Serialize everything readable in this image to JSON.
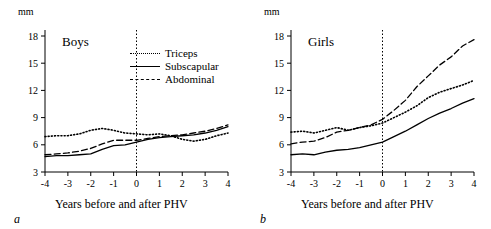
{
  "figure": {
    "unit_label": "mm",
    "axis_title": "Years before and after PHV",
    "panel_a_letter": "a",
    "panel_b_letter": "b"
  },
  "panels": [
    {
      "key": "boys",
      "title": "Boys",
      "letter": "a",
      "show_legend": true
    },
    {
      "key": "girls",
      "title": "Girls",
      "letter": "b",
      "show_legend": false
    }
  ],
  "legend": {
    "items": [
      {
        "label": "Triceps",
        "style": "dotted",
        "name": "triceps"
      },
      {
        "label": "Subscapular",
        "style": "solid",
        "name": "subscapular"
      },
      {
        "label": "Abdominal",
        "style": "dashed",
        "name": "abdominal"
      }
    ]
  },
  "chart_data": {
    "type": "line",
    "xlabel": "Years before and after PHV",
    "ylabel": "mm",
    "xlim": [
      -4,
      4
    ],
    "ylim": [
      3,
      18
    ],
    "xticks": [
      "-4",
      "-3",
      "-2",
      "-1",
      "0",
      "1",
      "2",
      "3",
      "4"
    ],
    "yticks": [
      "3",
      "6",
      "9",
      "12",
      "15",
      "18"
    ],
    "grid": false,
    "legend_position": "top-right-inside-panel-a",
    "annotations": [
      "vertical dotted reference line at x = 0 (PHV)"
    ],
    "panels": [
      {
        "name": "Boys",
        "letter": "a",
        "x": [
          -4,
          -3.5,
          -3,
          -2.5,
          -2,
          -1.5,
          -1,
          -0.5,
          0,
          0.5,
          1,
          1.5,
          2,
          2.5,
          3,
          3.5,
          4
        ],
        "series": [
          {
            "name": "Triceps",
            "style": "dotted",
            "values": [
              6.9,
              7.0,
              7.0,
              7.2,
              7.6,
              7.8,
              7.6,
              7.3,
              7.2,
              7.1,
              7.2,
              7.0,
              6.6,
              6.4,
              6.6,
              7.0,
              7.3
            ]
          },
          {
            "name": "Subscapular",
            "style": "solid",
            "values": [
              4.7,
              4.8,
              4.8,
              4.9,
              5.0,
              5.5,
              5.9,
              6.0,
              6.3,
              6.6,
              6.8,
              6.9,
              7.0,
              7.1,
              7.3,
              7.6,
              8.0
            ]
          },
          {
            "name": "Abdominal",
            "style": "dashed",
            "values": [
              4.9,
              5.0,
              5.1,
              5.3,
              5.6,
              6.1,
              6.5,
              6.5,
              6.5,
              6.7,
              6.9,
              7.0,
              7.1,
              7.3,
              7.5,
              7.8,
              8.2
            ]
          }
        ]
      },
      {
        "name": "Girls",
        "letter": "b",
        "x": [
          -4,
          -3.5,
          -3,
          -2.5,
          -2,
          -1.5,
          -1,
          -0.5,
          0,
          0.5,
          1,
          1.5,
          2,
          2.5,
          3,
          3.5,
          4
        ],
        "series": [
          {
            "name": "Triceps",
            "style": "dotted",
            "values": [
              7.4,
              7.5,
              7.3,
              7.6,
              7.9,
              7.6,
              7.9,
              8.1,
              8.4,
              9.0,
              9.6,
              10.3,
              11.2,
              11.8,
              12.2,
              12.6,
              13.1
            ]
          },
          {
            "name": "Subscapular",
            "style": "solid",
            "values": [
              4.9,
              5.0,
              4.9,
              5.2,
              5.4,
              5.5,
              5.7,
              6.0,
              6.3,
              6.9,
              7.5,
              8.2,
              8.9,
              9.5,
              10.0,
              10.6,
              11.1
            ]
          },
          {
            "name": "Abdominal",
            "style": "dashed",
            "values": [
              6.1,
              6.3,
              6.4,
              6.8,
              7.4,
              7.6,
              7.9,
              8.2,
              8.8,
              9.8,
              10.9,
              12.4,
              13.6,
              14.8,
              15.7,
              16.9,
              17.6
            ]
          }
        ]
      }
    ]
  }
}
